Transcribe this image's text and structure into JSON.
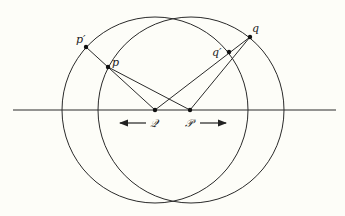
{
  "diagram": {
    "background": "#fdfdf8",
    "stroke_color": "#2a2a2a",
    "baseline": {
      "x1": 13,
      "x2": 336,
      "y": 110
    },
    "circles": [
      {
        "name": "left-circle",
        "cx": 155,
        "cy": 110,
        "r": 93
      },
      {
        "name": "right-circle",
        "cx": 191,
        "cy": 110,
        "r": 93
      }
    ],
    "points": {
      "p_prime": {
        "label": "p′",
        "x": 86,
        "y": 47
      },
      "p": {
        "label": "p",
        "x": 108,
        "y": 67
      },
      "q_prime": {
        "label": "q′",
        "x": 229,
        "y": 52
      },
      "q": {
        "label": "q",
        "x": 250,
        "y": 37
      },
      "Q": {
        "label": "𝒬",
        "x": 155,
        "y": 110
      },
      "P": {
        "label": "𝒫",
        "x": 190,
        "y": 110
      }
    },
    "labels": {
      "p_prime": "p′",
      "p": "p",
      "q_prime": "q′",
      "q": "q",
      "Q": "𝒬",
      "P": "𝒫"
    },
    "arrows": [
      {
        "name": "left-arrow",
        "direction": "left",
        "from_x": 146,
        "to_x": 118,
        "y": 123
      },
      {
        "name": "right-arrow",
        "direction": "right",
        "from_x": 200,
        "to_x": 228,
        "y": 123
      }
    ]
  }
}
